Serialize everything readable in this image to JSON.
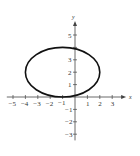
{
  "chart_data": {
    "type": "line",
    "title": "",
    "xlabel": "x",
    "ylabel": "y",
    "xlim": [
      -5.5,
      3.8
    ],
    "ylim": [
      -3.5,
      5.8
    ],
    "grid": false,
    "x_ticks": [
      -5,
      -4,
      -3,
      -2,
      -1,
      1,
      2,
      3
    ],
    "y_ticks": [
      5,
      3,
      2,
      1,
      -1,
      -2,
      -3
    ],
    "x_tick_labels": [
      "-5",
      "-4",
      "-3",
      "-2",
      "-1",
      "1",
      "2",
      "3"
    ],
    "y_tick_labels": [
      "5",
      "3",
      "2",
      "1",
      "-1",
      "-2",
      "-3"
    ],
    "series": [
      {
        "name": "ellipse",
        "shape": "ellipse",
        "center": [
          -1,
          2
        ],
        "rx": 3,
        "ry": 2,
        "color": "#111111"
      }
    ]
  },
  "axes": {
    "x_label": "x",
    "y_label": "y"
  }
}
